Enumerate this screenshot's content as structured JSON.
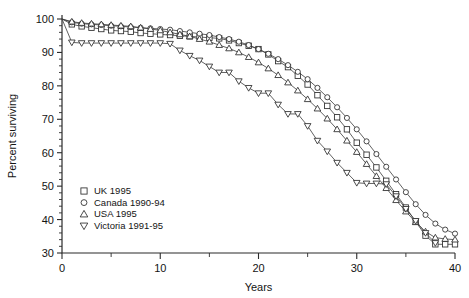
{
  "chart_data": {
    "type": "line",
    "title": "",
    "xlabel": "Years",
    "ylabel": "Percent surviving",
    "xlim": [
      0,
      40
    ],
    "ylim": [
      30,
      100
    ],
    "xticks": [
      0,
      10,
      20,
      30,
      40
    ],
    "xticklabels": [
      "0",
      "10",
      "20",
      "30",
      "40"
    ],
    "xminor_step": 5,
    "yticks": [
      30,
      40,
      50,
      60,
      70,
      80,
      90,
      100
    ],
    "yticklabels": [
      "30",
      "40",
      "50",
      "60",
      "70",
      "80",
      "90",
      "100"
    ],
    "yminor_step": 2,
    "grid": false,
    "legend_position": "lower-left",
    "series": [
      {
        "name": "UK 1995",
        "marker": "square",
        "x": [
          0,
          1,
          2,
          3,
          4,
          5,
          6,
          7,
          8,
          9,
          10,
          11,
          12,
          13,
          14,
          15,
          16,
          17,
          18,
          19,
          20,
          21,
          22,
          23,
          24,
          25,
          26,
          27,
          28,
          29,
          30,
          31,
          32,
          33,
          34,
          35,
          36,
          37,
          38,
          39,
          40
        ],
        "values": [
          100,
          98.4,
          97.8,
          97.4,
          97.0,
          96.6,
          96.4,
          96.2,
          95.8,
          95.6,
          95.4,
          95.2,
          95.0,
          94.8,
          94.6,
          94.4,
          94.2,
          93.6,
          92.8,
          92.0,
          91.0,
          89.4,
          87.4,
          85.6,
          83.0,
          80.4,
          77.2,
          74.0,
          70.6,
          67.0,
          63.0,
          59.4,
          55.6,
          51.6,
          47.6,
          43.6,
          39.4,
          35.2,
          32.6,
          32.6,
          32.6
        ]
      },
      {
        "name": "Canada 1990-94",
        "marker": "circle",
        "x": [
          0,
          1,
          2,
          3,
          4,
          5,
          6,
          7,
          8,
          9,
          10,
          11,
          12,
          13,
          14,
          15,
          16,
          17,
          18,
          19,
          20,
          21,
          22,
          23,
          24,
          25,
          26,
          27,
          28,
          29,
          30,
          31,
          32,
          33,
          34,
          35,
          36,
          37,
          38,
          39,
          40
        ],
        "values": [
          100,
          99.0,
          98.6,
          98.4,
          98.2,
          98.0,
          97.8,
          97.6,
          97.4,
          97.2,
          97.0,
          96.8,
          96.4,
          96.0,
          95.6,
          95.2,
          94.6,
          94.0,
          93.2,
          92.2,
          91.0,
          89.6,
          88.0,
          86.2,
          84.2,
          82.0,
          79.4,
          76.6,
          73.6,
          70.4,
          67.0,
          63.4,
          59.6,
          55.8,
          52.0,
          48.2,
          44.6,
          41.4,
          38.8,
          37.0,
          35.8
        ]
      },
      {
        "name": "USA 1995",
        "marker": "triangle-up",
        "x": [
          0,
          1,
          2,
          3,
          4,
          5,
          6,
          7,
          8,
          9,
          10,
          11,
          12,
          13,
          14,
          15,
          16,
          17,
          18,
          19,
          20,
          21,
          22,
          23,
          24,
          25,
          26,
          27,
          28,
          29,
          30,
          31,
          32,
          33,
          34,
          35,
          36,
          37,
          38,
          39,
          40
        ],
        "values": [
          100,
          99.2,
          98.8,
          98.6,
          98.4,
          98.2,
          98.0,
          97.8,
          97.4,
          97.0,
          96.6,
          96.0,
          95.4,
          94.8,
          94.0,
          93.2,
          92.2,
          91.2,
          90.0,
          88.6,
          87.0,
          85.2,
          83.2,
          81.0,
          78.6,
          76.0,
          73.2,
          70.2,
          67.0,
          63.6,
          60.2,
          56.6,
          53.0,
          49.4,
          45.8,
          42.4,
          39.2,
          36.4,
          34.6,
          34.2,
          34.0
        ]
      },
      {
        "name": "Victoria 1991-95",
        "marker": "triangle-down",
        "x": [
          0,
          1,
          2,
          3,
          4,
          5,
          6,
          7,
          8,
          9,
          10,
          11,
          12,
          13,
          14,
          15,
          16,
          17,
          18,
          19,
          20,
          21,
          22,
          23,
          24,
          25,
          26,
          27,
          28,
          29,
          30,
          31,
          32,
          33,
          34,
          35,
          36,
          37,
          38
        ],
        "values": [
          100,
          93.0,
          92.8,
          92.8,
          92.8,
          92.8,
          92.8,
          92.8,
          92.8,
          92.8,
          92.8,
          92.6,
          90.6,
          89.0,
          87.6,
          85.8,
          84.0,
          84.0,
          81.4,
          79.4,
          77.8,
          77.8,
          74.4,
          71.6,
          71.6,
          68.0,
          63.6,
          60.4,
          57.0,
          54.0,
          51.0,
          50.8,
          50.8,
          50.6,
          47.0,
          43.2,
          39.6,
          36.0,
          33.0
        ]
      }
    ]
  },
  "legend": {
    "entries": [
      {
        "label": "UK 1995",
        "marker": "square"
      },
      {
        "label": "Canada 1990-94",
        "marker": "circle"
      },
      {
        "label": "USA 1995",
        "marker": "triangle-up"
      },
      {
        "label": "Victoria 1991-95",
        "marker": "triangle-down"
      }
    ]
  }
}
